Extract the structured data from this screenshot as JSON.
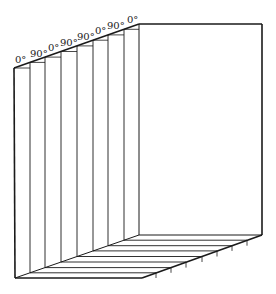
{
  "diagram": {
    "type": "laminate-stacking-sequence",
    "ply_count": 8,
    "stacking_sequence": [
      "0°",
      "90°",
      "0°",
      "90°",
      "90°",
      "0°",
      "90°",
      "0°"
    ],
    "colors": {
      "line": "#1a1a1a",
      "background": "#ffffff",
      "label": "#222222"
    },
    "plies": [
      {
        "label": "0°",
        "x": 14
      },
      {
        "label": "90°",
        "x": 30
      },
      {
        "label": "0°",
        "x": 45
      },
      {
        "label": "90°",
        "x": 61
      },
      {
        "label": "90°",
        "x": 77
      },
      {
        "label": "0°",
        "x": 93
      },
      {
        "label": "90°",
        "x": 108
      },
      {
        "label": "0°",
        "x": 124
      }
    ]
  }
}
